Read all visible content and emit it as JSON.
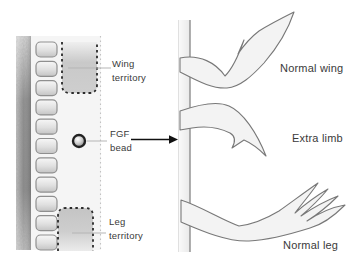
{
  "figure": {
    "embryo": {
      "wing_territory_label": "Wing territory",
      "fgf_bead_label": "FGF bead",
      "leg_territory_label": "Leg territory",
      "somite_count": 11
    },
    "results": {
      "normal_wing_label": "Normal wing",
      "extra_limb_label": "Extra limb",
      "normal_leg_label": "Normal leg"
    },
    "colors": {
      "territory_fill": "#c9c9c9",
      "dashed_outline": "#2b2b2b",
      "limb_fill": "#f3f3f3",
      "limb_outline": "#787878",
      "bead_ring": "#222222",
      "arrow": "#111111",
      "leader_line": "#b5b5b5",
      "text": "#3a3a3a"
    }
  }
}
